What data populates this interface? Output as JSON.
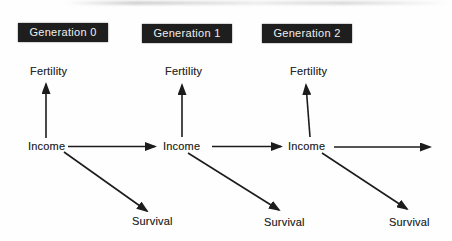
{
  "colors": {
    "background": "#fefefe",
    "generation_box_bg": "#1e1e1e",
    "generation_box_text": "#efefef",
    "label_text": "#2b2b2b",
    "arrow": "#1c1c1c"
  },
  "generations": [
    {
      "label": "Generation 0",
      "fertility": "Fertility",
      "income": "Income",
      "survival": "Survival"
    },
    {
      "label": "Generation 1",
      "fertility": "Fertility",
      "income": "Income",
      "survival": "Survival"
    },
    {
      "label": "Generation 2",
      "fertility": "Fertility",
      "income": "Income",
      "survival": "Survival"
    }
  ],
  "edges": [
    {
      "from": "income-gen0",
      "to": "fertility-gen0"
    },
    {
      "from": "income-gen0",
      "to": "survival-gen0"
    },
    {
      "from": "income-gen0",
      "to": "income-gen1"
    },
    {
      "from": "income-gen1",
      "to": "fertility-gen1"
    },
    {
      "from": "income-gen1",
      "to": "survival-gen1"
    },
    {
      "from": "income-gen1",
      "to": "income-gen2"
    },
    {
      "from": "income-gen2",
      "to": "fertility-gen2"
    },
    {
      "from": "income-gen2",
      "to": "survival-gen2"
    },
    {
      "from": "income-gen2",
      "to": "income-gen3-offscreen"
    }
  ]
}
